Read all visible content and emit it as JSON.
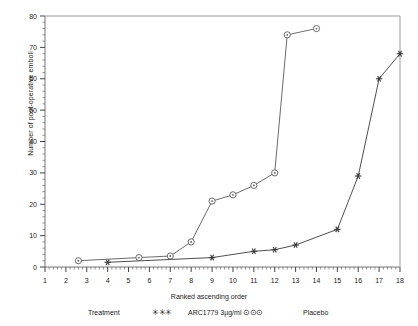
{
  "chart_data": {
    "type": "line",
    "title": "",
    "xlabel": "Ranked ascending order",
    "ylabel": "Number of post-operative emboli",
    "xlim": [
      1,
      18
    ],
    "ylim": [
      0,
      80
    ],
    "xticks": [
      1,
      2,
      3,
      4,
      5,
      6,
      7,
      8,
      9,
      10,
      11,
      12,
      13,
      14,
      15,
      16,
      17,
      18
    ],
    "yticks": [
      0,
      10,
      20,
      30,
      40,
      50,
      60,
      70,
      80
    ],
    "xtick_labels": [
      "1",
      "2",
      "3",
      "4",
      "5",
      "6",
      "7",
      "8",
      "9",
      "10",
      "11",
      "12",
      "13",
      "14",
      "15",
      "16",
      "17",
      "18"
    ],
    "ytick_labels": [
      "0",
      "10",
      "20",
      "30",
      "40",
      "50",
      "60",
      "70",
      "80"
    ],
    "grid": false,
    "minor_ticks": true,
    "legend_position": "below",
    "series": [
      {
        "name": "ARC1779 3µg/ml",
        "marker": "star",
        "color": "#3a3a3a",
        "points": [
          {
            "x": 4.0,
            "y": 1.5
          },
          {
            "x": 9.0,
            "y": 3.0
          },
          {
            "x": 11.0,
            "y": 5.0
          },
          {
            "x": 12.0,
            "y": 5.5
          },
          {
            "x": 13.0,
            "y": 7.0
          },
          {
            "x": 15.0,
            "y": 12.0
          },
          {
            "x": 16.0,
            "y": 29.0
          },
          {
            "x": 17.0,
            "y": 60.0
          },
          {
            "x": 18.0,
            "y": 68.0
          }
        ]
      },
      {
        "name": "Placebo",
        "marker": "circle",
        "color": "#5a5a5a",
        "points": [
          {
            "x": 2.6,
            "y": 2.0
          },
          {
            "x": 5.5,
            "y": 3.0
          },
          {
            "x": 7.0,
            "y": 3.5
          },
          {
            "x": 8.0,
            "y": 8.0
          },
          {
            "x": 9.0,
            "y": 21.0
          },
          {
            "x": 10.0,
            "y": 23.0
          },
          {
            "x": 11.0,
            "y": 26.0
          },
          {
            "x": 12.0,
            "y": 30.0
          },
          {
            "x": 12.6,
            "y": 74.0
          },
          {
            "x": 14.0,
            "y": 76.0
          }
        ]
      }
    ]
  },
  "legend": {
    "treatment_label": "Treatment",
    "treatment_symbol": "✳✳✳",
    "treatment_name": "ARC1779 3µg/ml",
    "placebo_symbol": "⊙⊙⊙",
    "placebo_name": "Placebo"
  },
  "axes": {
    "x_title": "Ranked ascending order",
    "y_title": "Number of post-operative emboli"
  }
}
